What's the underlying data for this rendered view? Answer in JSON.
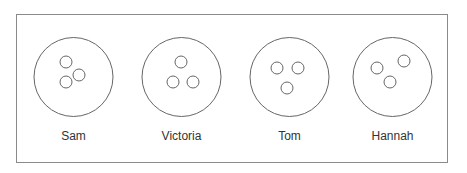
{
  "diagram": {
    "type": "circles-with-dots",
    "frame": {
      "x": 16,
      "y": 14,
      "width": 432,
      "height": 149
    },
    "stroke_color": "#666666",
    "plates": [
      {
        "name": "Sam",
        "cx": 73.5,
        "cy": 77,
        "r": 39.5,
        "dots": [
          {
            "cx": 66,
            "cy": 62,
            "r": 6
          },
          {
            "cx": 79,
            "cy": 75,
            "r": 6
          },
          {
            "cx": 66,
            "cy": 82,
            "r": 6
          }
        ]
      },
      {
        "name": "Victoria",
        "cx": 181.5,
        "cy": 77,
        "r": 39.5,
        "dots": [
          {
            "cx": 181,
            "cy": 62,
            "r": 6
          },
          {
            "cx": 173,
            "cy": 82,
            "r": 6
          },
          {
            "cx": 193,
            "cy": 82,
            "r": 6
          }
        ]
      },
      {
        "name": "Tom",
        "cx": 289.5,
        "cy": 77,
        "r": 39.5,
        "dots": [
          {
            "cx": 277,
            "cy": 68,
            "r": 6
          },
          {
            "cx": 298,
            "cy": 68,
            "r": 6
          },
          {
            "cx": 287,
            "cy": 88,
            "r": 6
          }
        ]
      },
      {
        "name": "Hannah",
        "cx": 392.5,
        "cy": 77,
        "r": 39.5,
        "dots": [
          {
            "cx": 377,
            "cy": 68,
            "r": 6
          },
          {
            "cx": 404,
            "cy": 61,
            "r": 6
          },
          {
            "cx": 390,
            "cy": 82,
            "r": 6
          }
        ]
      }
    ]
  },
  "labels": {
    "sam": "Sam",
    "victoria": "Victoria",
    "tom": "Tom",
    "hannah": "Hannah"
  }
}
